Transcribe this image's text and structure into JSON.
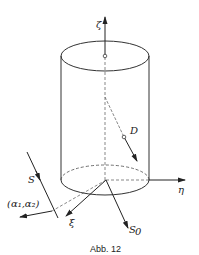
{
  "figure": {
    "caption": "Abb. 12",
    "labels": {
      "zeta": "ζ",
      "eta": "η",
      "xi": "ξ",
      "D": "D",
      "S": "S",
      "S0": "S",
      "S0_sub": "0",
      "alpha": "(α₁,α₂)"
    },
    "line_color": "#222222"
  }
}
